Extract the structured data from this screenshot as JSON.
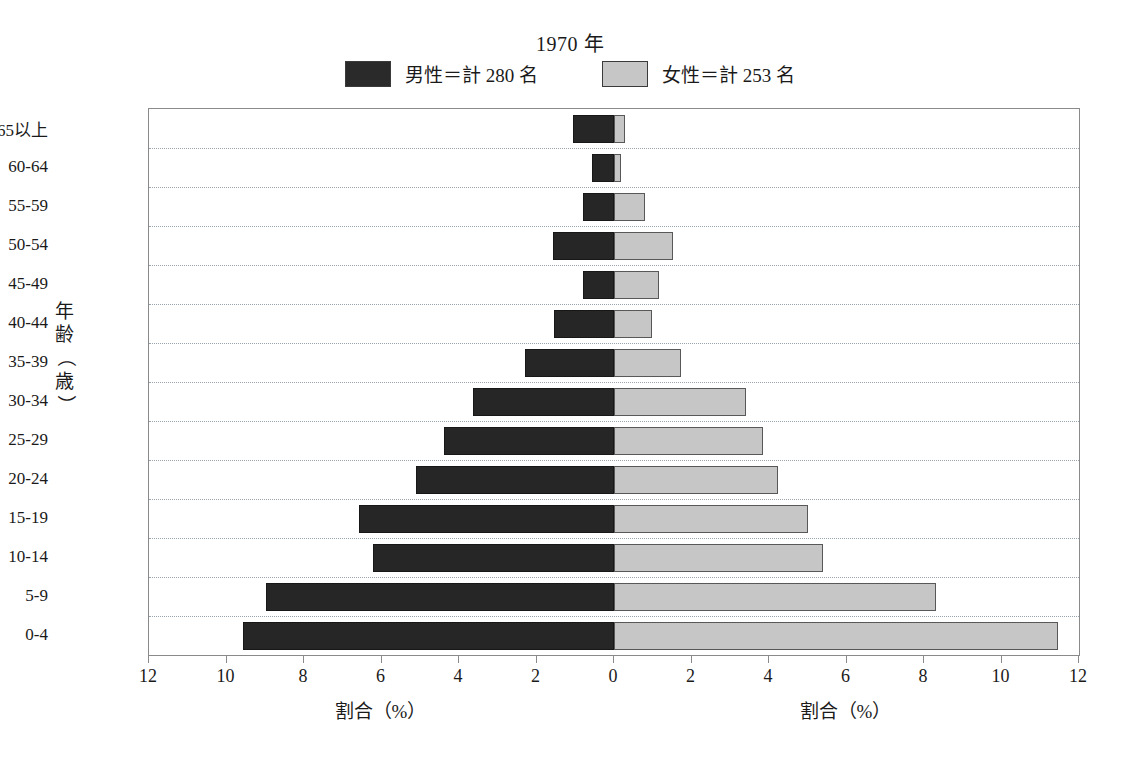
{
  "chart_data": {
    "type": "bar",
    "subtype": "population-pyramid",
    "title": "1970 年",
    "xlabel": "割合（%）",
    "ylabel": "年齢（歳）",
    "grid": true,
    "legend_position": "top-center",
    "xlim": [
      -12,
      12
    ],
    "xticks_left": [
      "12",
      "10",
      "8",
      "6",
      "4",
      "2"
    ],
    "xticks_center": "0",
    "xticks_right": [
      "2",
      "4",
      "6",
      "8",
      "10",
      "12"
    ],
    "xticks": [
      "12",
      "10",
      "8",
      "6",
      "4",
      "2",
      "0",
      "2",
      "4",
      "6",
      "8",
      "10",
      "12"
    ],
    "categories": [
      "65以上",
      "60-64",
      "55-59",
      "50-54",
      "45-49",
      "40-44",
      "35-39",
      "30-34",
      "25-29",
      "20-24",
      "15-19",
      "10-14",
      "5-9",
      "0-4"
    ],
    "series": [
      {
        "name": "男性＝計 280 名",
        "short_name": "男性",
        "side": "left",
        "color": "#262626",
        "total": 280,
        "values": [
          1.06,
          0.57,
          0.8,
          1.58,
          0.8,
          1.56,
          2.3,
          3.64,
          4.39,
          5.11,
          6.58,
          6.22,
          8.98,
          9.58
        ]
      },
      {
        "name": "女性＝計 253 名",
        "short_name": "女性",
        "side": "right",
        "color": "#c6c6c6",
        "total": 253,
        "values": [
          0.28,
          0.18,
          0.8,
          1.52,
          1.17,
          0.98,
          1.73,
          3.41,
          3.85,
          4.23,
          5.01,
          5.39,
          8.31,
          11.45
        ]
      }
    ]
  },
  "legend": {
    "male_label": "男性＝計 280 名",
    "female_label": "女性＝計 253 名",
    "male_color": "#262626",
    "female_color": "#c6c6c6"
  },
  "axis": {
    "y_title_chars": [
      "年",
      "齢",
      "（",
      "歳",
      "）"
    ],
    "x_title_left": "割合（%）",
    "x_title_right": "割合（%）"
  }
}
